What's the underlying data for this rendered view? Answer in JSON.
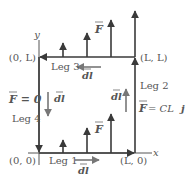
{
  "diagram": {
    "colors": {
      "line": "#3a3a3a",
      "text": "#555555",
      "arrow": "#666666"
    },
    "axes": {
      "x_label": "x",
      "y_label": "y"
    },
    "corners": {
      "origin": "(0, 0)",
      "bottom_right": "(L, 0)",
      "top_right": "(L, L)",
      "top_left": "(0, L)"
    },
    "legs": [
      {
        "name": "Leg 1",
        "direction": "right",
        "dl_label": "dl"
      },
      {
        "name": "Leg 2",
        "direction": "up",
        "dl_label": "dl"
      },
      {
        "name": "Leg 3",
        "direction": "left",
        "dl_label": "dl"
      },
      {
        "name": "Leg 4",
        "direction": "down",
        "dl_label": "dl"
      }
    ],
    "force_labels": {
      "generic": "F",
      "left_edge": "F = 0",
      "right_edge_lhs": "F",
      "right_edge_rhs": "= CL",
      "unit_vector": "j"
    }
  }
}
